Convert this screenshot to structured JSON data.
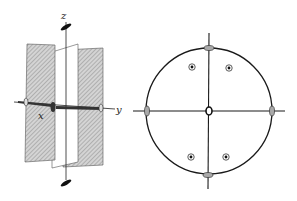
{
  "figure": {
    "left_panel": {
      "description": "3D view of mirror planes with symmetry axes",
      "axis_labels": {
        "z": "z",
        "x": "x",
        "y": "y"
      }
    },
    "right_panel": {
      "description": "Stereographic projection",
      "center": [
        209,
        111
      ],
      "radius": 63,
      "poles": [
        {
          "x": 192,
          "y": 67
        },
        {
          "x": 229,
          "y": 68
        },
        {
          "x": 191,
          "y": 157
        },
        {
          "x": 226,
          "y": 157
        }
      ]
    },
    "colors": {
      "ink": "#1a1a1a",
      "hatch": "#9a9a9a",
      "plane_fill": "#cfcfcf"
    }
  }
}
